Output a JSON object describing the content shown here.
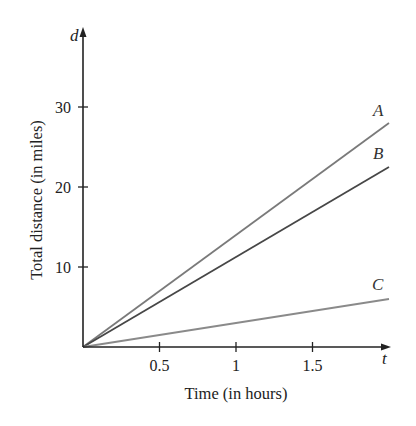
{
  "chart_data": {
    "type": "line",
    "title": "",
    "xlabel": "Time (in hours)",
    "ylabel": "Total distance (in miles)",
    "x_axis_var": "t",
    "y_axis_var": "d",
    "xlim": [
      0,
      2
    ],
    "ylim": [
      0,
      35
    ],
    "x_ticks": [
      0.5,
      1,
      1.5
    ],
    "x_tick_labels": [
      "0.5",
      "1",
      "1.5"
    ],
    "y_ticks": [
      10,
      20,
      30
    ],
    "y_tick_labels": [
      "10",
      "20",
      "30"
    ],
    "grid": false,
    "legend": "inline labels at line ends",
    "series": [
      {
        "name": "A",
        "x": [
          0,
          2
        ],
        "values": [
          0,
          28
        ],
        "color": "#7a7a7a"
      },
      {
        "name": "B",
        "x": [
          0,
          2
        ],
        "values": [
          0,
          22.5
        ],
        "color": "#474747"
      },
      {
        "name": "C",
        "x": [
          0,
          2
        ],
        "values": [
          0,
          6
        ],
        "color": "#8a8a8a"
      }
    ]
  },
  "colors": {
    "axis": "#222222",
    "background": "#ffffff"
  }
}
